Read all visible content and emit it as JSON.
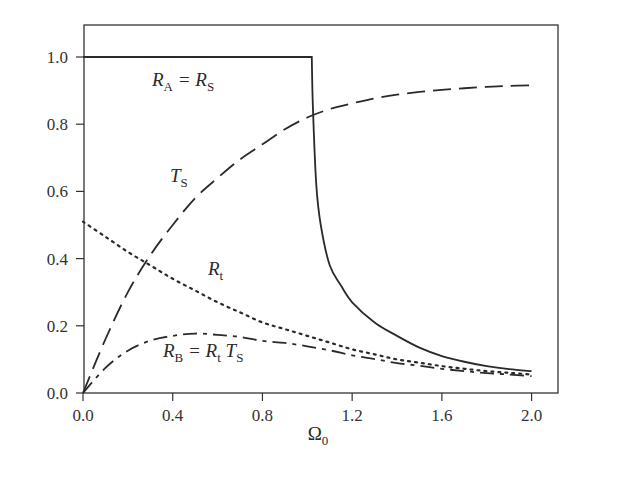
{
  "chart_data": {
    "type": "line",
    "title": "",
    "xlabel": "Ω0",
    "ylabel": "",
    "xlim": [
      0.0,
      2.1
    ],
    "ylim": [
      0.0,
      1.08
    ],
    "grid": false,
    "legend": "inline labels",
    "x_ticks": [
      "0.0",
      "0.4",
      "0.8",
      "1.2",
      "1.6",
      "2.0"
    ],
    "y_ticks": [
      "0.0",
      "0.2",
      "0.4",
      "0.6",
      "0.8",
      "1.0"
    ],
    "x": [
      0.0,
      0.1,
      0.2,
      0.3,
      0.4,
      0.5,
      0.6,
      0.7,
      0.8,
      0.9,
      1.0,
      1.1,
      1.2,
      1.3,
      1.4,
      1.5,
      1.6,
      1.7,
      1.8,
      1.9,
      2.0
    ],
    "series": [
      {
        "name": "R_A = R_S",
        "style": "solid",
        "label_parts": [
          "R",
          "A",
          " = R",
          "S"
        ],
        "points": [
          [
            0.0,
            1.0
          ],
          [
            1.02,
            1.0
          ],
          [
            1.025,
            0.85
          ],
          [
            1.04,
            0.62
          ],
          [
            1.06,
            0.5
          ],
          [
            1.1,
            0.38
          ],
          [
            1.15,
            0.32
          ],
          [
            1.2,
            0.27
          ],
          [
            1.3,
            0.21
          ],
          [
            1.4,
            0.17
          ],
          [
            1.5,
            0.135
          ],
          [
            1.6,
            0.11
          ],
          [
            1.7,
            0.093
          ],
          [
            1.8,
            0.08
          ],
          [
            1.9,
            0.071
          ],
          [
            2.0,
            0.065
          ]
        ]
      },
      {
        "name": "T_S",
        "style": "long-dash",
        "label_parts": [
          "T",
          "S"
        ],
        "values": [
          0.0,
          0.16,
          0.3,
          0.41,
          0.5,
          0.58,
          0.64,
          0.695,
          0.74,
          0.785,
          0.82,
          0.845,
          0.862,
          0.877,
          0.888,
          0.896,
          0.902,
          0.907,
          0.911,
          0.914,
          0.916
        ]
      },
      {
        "name": "R_t",
        "style": "dotted",
        "label_parts": [
          "R",
          "t"
        ],
        "values": [
          0.51,
          0.465,
          0.42,
          0.38,
          0.34,
          0.305,
          0.27,
          0.24,
          0.21,
          0.19,
          0.17,
          0.15,
          0.13,
          0.115,
          0.1,
          0.09,
          0.08,
          0.072,
          0.065,
          0.06,
          0.055
        ]
      },
      {
        "name": "R_B = R_t T_S",
        "style": "dash-dot",
        "label_parts": [
          "R",
          "B",
          " = R",
          "t",
          " T",
          "S"
        ],
        "values": [
          0.0,
          0.075,
          0.126,
          0.156,
          0.17,
          0.177,
          0.173,
          0.167,
          0.155,
          0.149,
          0.139,
          0.127,
          0.112,
          0.101,
          0.089,
          0.081,
          0.072,
          0.065,
          0.059,
          0.055,
          0.05
        ]
      }
    ]
  }
}
